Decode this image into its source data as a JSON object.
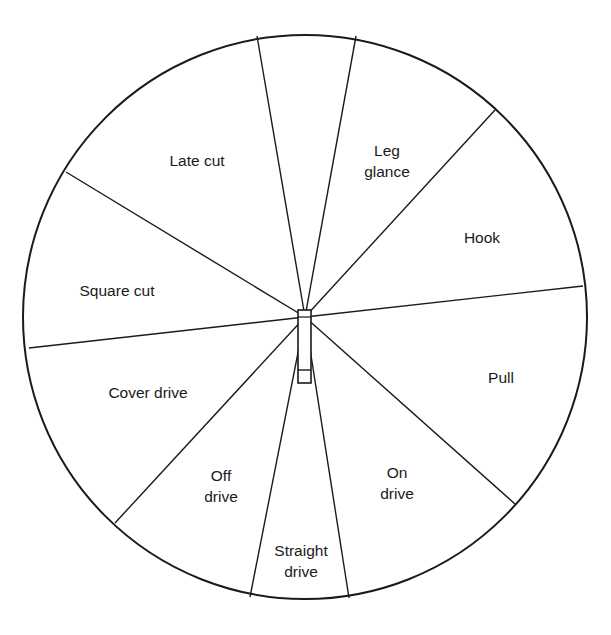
{
  "diagram": {
    "type": "cricket-shot-wheel",
    "circle": {
      "cx": 305,
      "cy": 317,
      "r": 282,
      "stroke": "#1a1a1a"
    },
    "spokes": [
      {
        "x2": 257,
        "y2": 36
      },
      {
        "x2": 356,
        "y2": 36
      },
      {
        "x2": 495,
        "y2": 110
      },
      {
        "x2": 583,
        "y2": 286
      },
      {
        "x2": 515,
        "y2": 504
      },
      {
        "x2": 349,
        "y2": 598
      },
      {
        "x2": 250,
        "y2": 597
      },
      {
        "x2": 115,
        "y2": 523
      },
      {
        "x2": 29,
        "y2": 348
      },
      {
        "x2": 66,
        "y2": 172
      }
    ],
    "bat": {
      "x": 298,
      "y": 310,
      "w": 13,
      "h": 73,
      "handle_y": 370
    },
    "sectors": [
      {
        "label": "Late cut",
        "x": 197,
        "y": 160
      },
      {
        "label": "Leg\nglance",
        "x": 387,
        "y": 161
      },
      {
        "label": "Hook",
        "x": 482,
        "y": 237
      },
      {
        "label": "Pull",
        "x": 501,
        "y": 377
      },
      {
        "label": "On\ndrive",
        "x": 397,
        "y": 483
      },
      {
        "label": "Straight\ndrive",
        "x": 301,
        "y": 561
      },
      {
        "label": "Off\ndrive",
        "x": 221,
        "y": 486
      },
      {
        "label": "Cover drive",
        "x": 148,
        "y": 392
      },
      {
        "label": "Square cut",
        "x": 117,
        "y": 290
      }
    ]
  }
}
